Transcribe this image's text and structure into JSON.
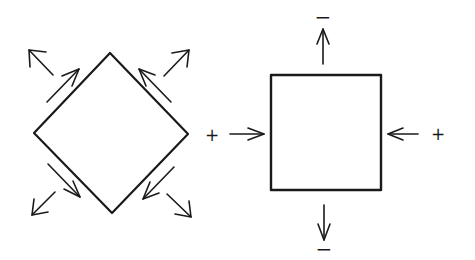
{
  "diagram": {
    "type": "stress-element-comparison",
    "stroke_color": "#1a1a1a",
    "background": "#ffffff",
    "left_element": {
      "shape": "diamond (square rotated 45°)",
      "description": "Element under pure shear: shear arrows along each edge, diagonal outward arrows at each corner region",
      "corner_arrows": [
        "up-left",
        "up-right",
        "down-left",
        "down-right"
      ],
      "shear_arrows": [
        "upper-left edge pointing up-right",
        "upper-right edge pointing up-left",
        "lower-left edge pointing down-right",
        "lower-right edge pointing down-left"
      ]
    },
    "right_element": {
      "shape": "square",
      "description": "Element rotated to principal axes: compressive arrows on left/right, tensile arrows on top/bottom",
      "labels": {
        "top": "−",
        "bottom": "−",
        "left": "+",
        "right": "+"
      },
      "arrows": {
        "top": "outward (up)",
        "bottom": "outward (down)",
        "left": "inward (right)",
        "right": "inward (left)"
      }
    },
    "between_label": "+"
  }
}
